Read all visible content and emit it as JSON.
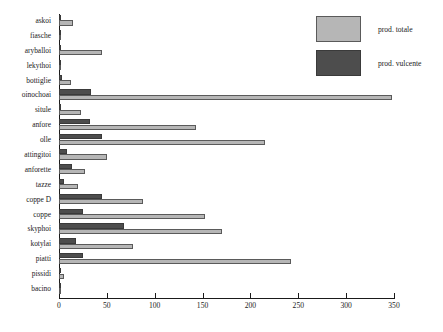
{
  "chart_data": {
    "type": "bar",
    "orientation": "horizontal",
    "title": "",
    "xlabel": "",
    "ylabel": "",
    "xlim": [
      0,
      350
    ],
    "xticks": [
      0,
      50,
      100,
      150,
      200,
      250,
      300,
      350
    ],
    "grid": false,
    "legend_position": "top-right",
    "categories": [
      "askoi",
      "fiasche",
      "aryballoi",
      "lekythoi",
      "bottiglie",
      "oinochoai",
      "situle",
      "anfore",
      "olle",
      "attingitoi",
      "anforette",
      "tazze",
      "coppe D",
      "coppe",
      "skyphoi",
      "kotylai",
      "piatti",
      "pissidi",
      "bacino"
    ],
    "series": [
      {
        "name": "prod. totale",
        "color": "#b6b6b6",
        "values": [
          15,
          2,
          45,
          1,
          13,
          348,
          23,
          143,
          215,
          50,
          27,
          20,
          88,
          153,
          170,
          77,
          242,
          5,
          2
        ]
      },
      {
        "name": "prod. vulcente",
        "color": "#4d4d4d",
        "values": [
          1,
          1,
          1,
          1,
          3,
          33,
          2,
          32,
          45,
          8,
          14,
          5,
          45,
          25,
          68,
          18,
          25,
          1,
          1
        ]
      }
    ]
  },
  "legend": {
    "items": [
      {
        "label": "prod. totale",
        "swatch": "total"
      },
      {
        "label": "prod. vulcente",
        "swatch": "vulcente"
      }
    ]
  }
}
